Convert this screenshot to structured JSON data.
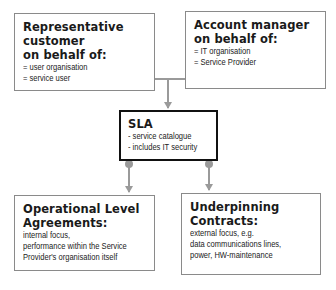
{
  "diagram": {
    "boxes": {
      "customer": {
        "title_lines": [
          "Representative customer",
          "on behalf of:"
        ],
        "items": [
          "= user organisation",
          "= service user"
        ]
      },
      "account_manager": {
        "title_lines": [
          "Account manager",
          "on behalf of:"
        ],
        "items": [
          "= IT organisation",
          "= Service Provider"
        ]
      },
      "sla": {
        "title": "SLA",
        "items": [
          "- service catalogue",
          "- includes IT security"
        ]
      },
      "ola": {
        "title_lines": [
          "Operational Level",
          "Agreements:"
        ],
        "items": [
          "internal focus,",
          "performance within the Service",
          "Provider's organisation itself"
        ]
      },
      "uc": {
        "title_lines": [
          "Underpinning Contracts:"
        ],
        "items": [
          "external focus, e.g.",
          "data communications lines,",
          "power, HW-maintenance"
        ]
      }
    },
    "connectors": {
      "color": "#9a9a9a",
      "sla_border_color": "#111111",
      "box_border_color": "#8a8a8a"
    }
  }
}
